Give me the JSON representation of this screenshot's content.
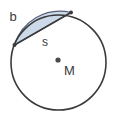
{
  "figure": {
    "kind": "circle-segment-geometry-diagram",
    "canvas": {
      "width": 116,
      "height": 123,
      "background": "#ffffff"
    },
    "colors": {
      "outline": "#3a3a3a",
      "segment_fill": "#ccd9e8",
      "segment_stroke": "#55607a",
      "label": "#3b3b3b",
      "center_dot": "#4a4a4a"
    },
    "circle": {
      "center_x": 58.5,
      "center_y": 62.5,
      "radius": 47.5,
      "stroke_width": 1.6
    },
    "center_point": {
      "label": "M",
      "dot_x": 58,
      "dot_y": 60,
      "dot_radius": 2.6,
      "label_x": 64,
      "label_y": 75
    },
    "chord": {
      "label": "s",
      "x1": 14.5,
      "y1": 45.0,
      "x2": 71.0,
      "y2": 12.5,
      "label_x": 45,
      "label_y": 46
    },
    "arc": {
      "label": "b",
      "label_x": 13,
      "label_y": 21,
      "description": "minor arc from chord endpoint to chord endpoint, upper-left of circle"
    },
    "endpoint_markers": [
      {
        "x": 14.5,
        "y": 45.0,
        "radius": 2.0
      },
      {
        "x": 71.0,
        "y": 12.5,
        "radius": 2.0
      }
    ]
  }
}
